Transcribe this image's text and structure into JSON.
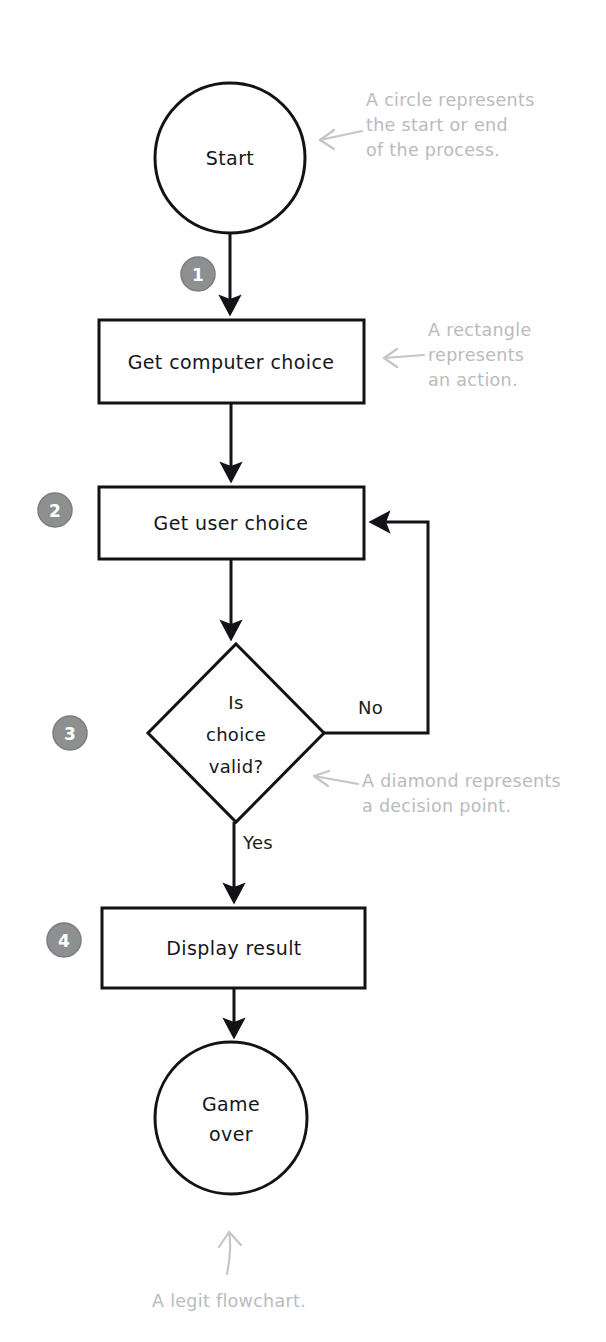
{
  "diagram": {
    "colors": {
      "stroke": "#121317",
      "text": "#15161a",
      "badge_fill": "#8d8f91",
      "badge_text": "#ffffff",
      "annotation": "#b9bbbd",
      "background": "#ffffff"
    },
    "nodes": [
      {
        "id": "start",
        "type": "circle",
        "label": "Start",
        "cx": 230,
        "cy": 158,
        "r": 75
      },
      {
        "id": "compchoice",
        "type": "rectangle",
        "label": "Get computer choice",
        "x": 99,
        "y": 320,
        "w": 265,
        "h": 83
      },
      {
        "id": "userchoice",
        "type": "rectangle",
        "label": "Get user choice",
        "x": 99,
        "y": 487,
        "w": 265,
        "h": 72
      },
      {
        "id": "valid",
        "type": "diamond",
        "label_lines": [
          "Is",
          "choice",
          "valid?"
        ],
        "cx": 236,
        "cy": 733,
        "rx": 88,
        "ry": 89
      },
      {
        "id": "display",
        "type": "rectangle",
        "label": "Display result",
        "x": 102,
        "y": 908,
        "w": 263,
        "h": 80
      },
      {
        "id": "end",
        "type": "circle",
        "label_lines": [
          "Game",
          "over"
        ],
        "cx": 231,
        "cy": 1118,
        "r": 76
      }
    ],
    "edge_labels": [
      {
        "id": "no",
        "text": "No",
        "x": 358,
        "y": 714
      },
      {
        "id": "yes",
        "text": "Yes",
        "x": 243,
        "y": 849
      }
    ],
    "badges": [
      {
        "id": "badge-1",
        "number": "1",
        "cx": 198,
        "cy": 274
      },
      {
        "id": "badge-2",
        "number": "2",
        "cx": 55,
        "cy": 510
      },
      {
        "id": "badge-3",
        "number": "3",
        "cx": 70,
        "cy": 733
      },
      {
        "id": "badge-4",
        "number": "4",
        "cx": 64,
        "cy": 940
      }
    ],
    "annotations": [
      {
        "id": "circle-note",
        "text": "A circle represents\nthe start or end\nof the process.",
        "x": 366,
        "y": 88
      },
      {
        "id": "rectangle-note",
        "text": "A rectangle\nrepresents\nan action.",
        "x": 428,
        "y": 318
      },
      {
        "id": "diamond-note",
        "text": "A diamond represents\na decision point.",
        "x": 362,
        "y": 769
      }
    ],
    "caption": {
      "id": "flowchart-caption",
      "text": "A legit flowchart.",
      "x": 152,
      "y": 1291
    }
  }
}
